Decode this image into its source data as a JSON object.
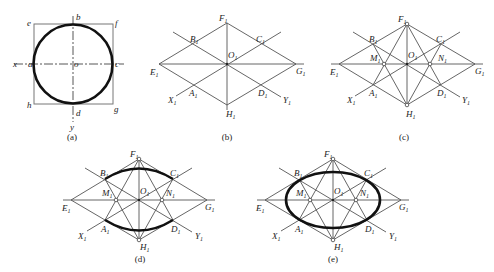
{
  "panels": {
    "a": {
      "caption": "(a)",
      "labels": {
        "a": "a",
        "b": "b",
        "c": "c",
        "d": "d",
        "e": "e",
        "f": "f",
        "g": "g",
        "h": "h",
        "o": "o",
        "x": "x",
        "y": "y"
      }
    },
    "b": {
      "caption": "(b)",
      "labels": {
        "A": "A",
        "B": "B",
        "C": "C",
        "D": "D",
        "E": "E",
        "F": "F",
        "G": "G",
        "H": "H",
        "O": "O",
        "X": "X",
        "Y": "Y",
        "sub": "1"
      }
    },
    "c": {
      "caption": "(c)",
      "labels": {
        "A": "A",
        "B": "B",
        "C": "C",
        "D": "D",
        "E": "E",
        "F": "F",
        "G": "G",
        "H": "H",
        "O": "O",
        "M": "M",
        "N": "N",
        "X": "X",
        "Y": "Y",
        "sub": "1"
      }
    },
    "d": {
      "caption": "(d)",
      "labels": {
        "A": "A",
        "B": "B",
        "C": "C",
        "D": "D",
        "E": "E",
        "F": "F",
        "G": "G",
        "H": "H",
        "O": "O",
        "M": "M",
        "N": "N",
        "X": "X",
        "Y": "Y",
        "sub": "1"
      }
    },
    "e": {
      "caption": "(e)",
      "labels": {
        "A": "A",
        "B": "B",
        "C": "C",
        "D": "D",
        "E": "E",
        "F": "F",
        "G": "G",
        "H": "H",
        "O": "O",
        "M": "M",
        "N": "N",
        "X": "X",
        "Y": "Y",
        "sub": "1"
      }
    }
  }
}
